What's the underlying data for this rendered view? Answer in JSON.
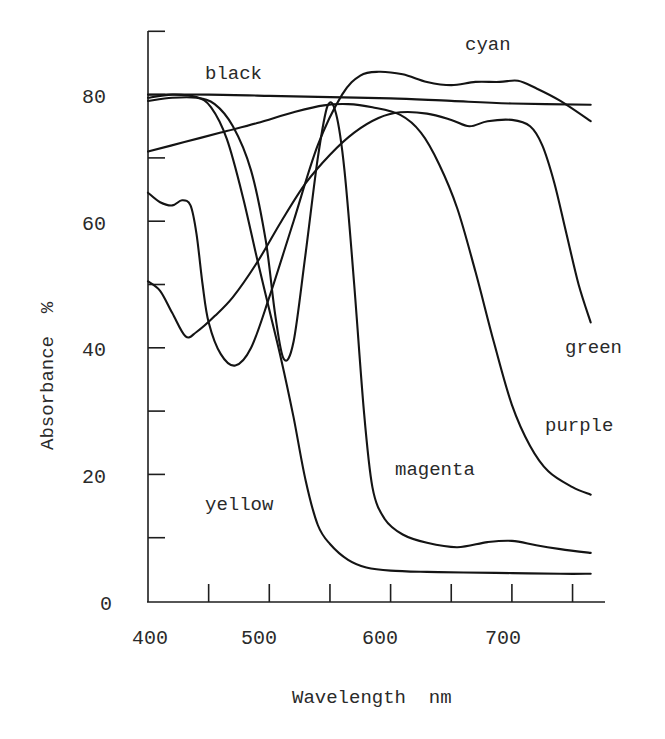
{
  "chart_data": {
    "type": "line",
    "title": "",
    "xlabel": "Wavelength  nm",
    "ylabel": "Absorbance  %",
    "xlim": [
      400,
      780
    ],
    "ylim": [
      0,
      90
    ],
    "grid": false,
    "legend": "inline labels",
    "x_ticks": [
      400,
      450,
      500,
      550,
      600,
      650,
      700,
      750
    ],
    "x_tick_labels": [
      "400",
      "",
      "500",
      "",
      "600",
      "",
      "700",
      ""
    ],
    "y_ticks": [
      0,
      10,
      20,
      30,
      40,
      50,
      60,
      70,
      80,
      90
    ],
    "y_tick_labels": [
      "0",
      "",
      "20",
      "",
      "40",
      "",
      "60",
      "",
      "80",
      ""
    ],
    "series": [
      {
        "name": "black",
        "x": [
          400,
          450,
          500,
          550,
          600,
          650,
          700,
          765
        ],
        "values": [
          80,
          80,
          79.8,
          79.6,
          79.4,
          79,
          78.6,
          78.4
        ]
      },
      {
        "name": "cyan",
        "x": [
          400,
          410,
          420,
          428,
          435,
          440,
          445,
          450,
          460,
          472,
          485,
          500,
          520,
          540,
          560,
          575,
          590,
          610,
          630,
          650,
          670,
          690,
          705,
          720,
          740,
          765
        ],
        "values": [
          64.5,
          63,
          62.5,
          63.3,
          62.5,
          58,
          50,
          44,
          39,
          37.2,
          40,
          48,
          60,
          72,
          80,
          83,
          83.6,
          83.2,
          82,
          81.5,
          82,
          82,
          82.2,
          81,
          79,
          75.8
        ]
      },
      {
        "name": "green",
        "x": [
          400,
          410,
          420,
          431,
          440,
          455,
          470,
          490,
          510,
          530,
          550,
          570,
          590,
          608,
          630,
          650,
          665,
          680,
          700,
          715,
          725,
          735,
          745,
          755,
          765
        ],
        "values": [
          50.5,
          49,
          45.5,
          41.8,
          42.5,
          45,
          48,
          53.5,
          60,
          66,
          70.5,
          74,
          76.3,
          77.2,
          77,
          76,
          75,
          75.8,
          76,
          75,
          72,
          66,
          58,
          50,
          44
        ]
      },
      {
        "name": "purple",
        "x": [
          400,
          430,
          460,
          490,
          520,
          545,
          565,
          585,
          608,
          625,
          640,
          655,
          670,
          685,
          700,
          715,
          730,
          750,
          765
        ],
        "values": [
          71,
          72.5,
          74,
          75.5,
          77.2,
          78.3,
          78.5,
          78,
          76.8,
          74,
          69,
          62,
          52,
          41,
          31,
          24.5,
          20.5,
          18,
          16.8
        ]
      },
      {
        "name": "magenta",
        "x": [
          400,
          420,
          440,
          455,
          470,
          485,
          497,
          505,
          512,
          520,
          530,
          540,
          548,
          555,
          562,
          570,
          578,
          585,
          595,
          610,
          630,
          655,
          680,
          700,
          720,
          740,
          765
        ],
        "values": [
          79,
          79.5,
          79.5,
          78.5,
          75,
          68,
          57,
          45,
          38.2,
          41,
          55,
          70,
          78.2,
          77,
          68,
          50,
          30,
          18,
          13,
          10.5,
          9.2,
          8.5,
          9.3,
          9.5,
          8.8,
          8.2,
          7.6
        ]
      },
      {
        "name": "yellow",
        "x": [
          400,
          420,
          440,
          452,
          465,
          478,
          490,
          500,
          510,
          520,
          530,
          540,
          550,
          565,
          580,
          600,
          630,
          660,
          700,
          740,
          765
        ],
        "values": [
          79.5,
          80,
          79.6,
          78,
          73,
          64,
          54,
          46,
          38,
          29,
          19,
          12,
          9,
          6.5,
          5.3,
          4.8,
          4.6,
          4.5,
          4.4,
          4.3,
          4.3
        ]
      }
    ],
    "annotations": [
      {
        "text": "black",
        "x": 455,
        "y": 83.5
      },
      {
        "text": "cyan",
        "x": 625,
        "y": 88.5
      },
      {
        "text": "green",
        "x": 795,
        "y": 40
      },
      {
        "text": "purple",
        "x": 775,
        "y": 26.5
      },
      {
        "text": "magenta",
        "x": 595,
        "y": 20
      },
      {
        "text": "yellow",
        "x": 450,
        "y": 14.5
      }
    ]
  },
  "labels": {
    "xlabel": "Wavelength  nm",
    "ylabel": "Absorbance  %",
    "black": "black",
    "cyan": "cyan",
    "green": "green",
    "purple": "purple",
    "magenta": "magenta",
    "yellow": "yellow",
    "x400": "400",
    "x500": "500",
    "x600": "600",
    "x700": "700",
    "y0": "0",
    "y20": "20",
    "y40": "40",
    "y60": "60",
    "y80": "80"
  }
}
